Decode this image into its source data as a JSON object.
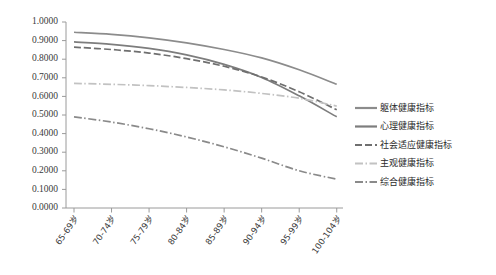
{
  "chart_data": {
    "type": "line",
    "title": "",
    "xlabel": "",
    "ylabel": "",
    "categories": [
      "65-69岁",
      "70-74岁",
      "75-79岁",
      "80-84岁",
      "85-89岁",
      "90-94岁",
      "95-99岁",
      "100-104岁"
    ],
    "ylim": [
      0.0,
      1.0
    ],
    "ytick_labels": [
      "1.0000",
      "0.9000",
      "0.8000",
      "0.7000",
      "0.6000",
      "0.5000",
      "0.4000",
      "0.3000",
      "0.2000",
      "0.1000",
      "0.0000"
    ],
    "ytick_values": [
      1.0,
      0.9,
      0.8,
      0.7,
      0.6,
      0.5,
      0.4,
      0.3,
      0.2,
      0.1,
      0.0
    ],
    "grid": false,
    "legend_position": "right",
    "series": [
      {
        "name": "躯体健康指标",
        "style": "solid",
        "color": "#8c8c8c",
        "values": [
          0.945,
          0.934,
          0.915,
          0.888,
          0.852,
          0.807,
          0.743,
          0.665
        ]
      },
      {
        "name": "心理健康指标",
        "style": "solid",
        "color": "#7d7d7d",
        "values": [
          0.893,
          0.88,
          0.858,
          0.823,
          0.772,
          0.702,
          0.603,
          0.49
        ]
      },
      {
        "name": "社会适应健康指标",
        "style": "long-dash",
        "color": "#6f6f6f",
        "values": [
          0.865,
          0.852,
          0.833,
          0.803,
          0.762,
          0.704,
          0.625,
          0.528
        ]
      },
      {
        "name": "主观健康指标",
        "style": "dash-dot",
        "color": "#c2c2c2",
        "values": [
          0.67,
          0.665,
          0.658,
          0.648,
          0.635,
          0.616,
          0.59,
          0.548
        ]
      },
      {
        "name": "综合健康指标",
        "style": "dash-dot",
        "color": "#8a8a8a",
        "values": [
          0.49,
          0.462,
          0.426,
          0.382,
          0.329,
          0.268,
          0.2,
          0.155
        ]
      }
    ]
  },
  "legend": {
    "items": [
      {
        "label": "躯体健康指标"
      },
      {
        "label": "心理健康指标"
      },
      {
        "label": "社会适应健康指标"
      },
      {
        "label": "主观健康指标"
      },
      {
        "label": "综合健康指标"
      }
    ]
  }
}
